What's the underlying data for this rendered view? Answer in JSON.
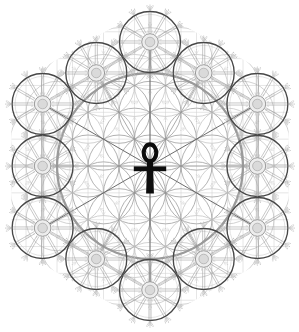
{
  "diagram": {
    "central_symbol": "ankh-icon",
    "canvas": {
      "width": 299,
      "height": 332,
      "background": "#ffffff"
    },
    "center": {
      "x": 150,
      "y": 166
    },
    "lattice_spacing": 31,
    "row_height": 26.846,
    "clip_hex_radius": 160,
    "grid": {
      "h_half_count": 6,
      "v_half_count": 9,
      "v_spacing": 15.5
    },
    "flower": {
      "petal_radius": 31,
      "extent": 122,
      "inner_extent": 63,
      "ghost_burst_min_dist": 80
    },
    "big_circle": {
      "radius": 93,
      "outer_radius": 96.5
    },
    "ring": {
      "wheel_count": 12,
      "start_angle_deg": -90,
      "step_angle_deg": 30,
      "vertex_ring_radius": 124,
      "mid_ring_radius": 107.4
    },
    "wheel": {
      "radius": 30.5,
      "inner_ring_radius": 27.6,
      "spoke_count": 12,
      "spoke_inner_radius": 9.2,
      "spoke_outer_radius": 29.8,
      "spoke_pair_offset": 1.05,
      "hub_radius": 8.3,
      "hub_inner_radius": 4.8,
      "hub_tick_count": 16,
      "hub_tick_r1": 9.3,
      "hub_tick_r2": 11.8,
      "burst_count": 12,
      "burst_ray_spreads": [
        -36,
        -18,
        0,
        18,
        36
      ],
      "burst_ray_start": 0.8,
      "burst_ray_end": 5.3,
      "burst_dot_spreads": [
        -30,
        0,
        30
      ],
      "burst_dot_dist": 6.0,
      "burst_dot_r": 0.6
    },
    "ghost_burst": {
      "count": 6,
      "ray_spreads": [
        -25,
        0,
        25
      ],
      "ray_start": 0.8,
      "ray_end": 4.2,
      "dot_dist": 5.0,
      "dot_r": 0.55
    },
    "ankh": {
      "loop_cx": 150,
      "loop_cy": 152.8,
      "loop_rx": 6.3,
      "loop_ry": 8.4,
      "loop_stroke": 4.1,
      "shaft_top": 160.5,
      "shaft_bottom": 193.5,
      "shaft_top_halfwidth": 2.9,
      "shaft_bottom_halfwidth": 3.9,
      "bar_x": 133.8,
      "bar_y": 166.4,
      "bar_w": 32.4,
      "bar_h": 4.8
    },
    "colors": {
      "background": "#ffffff",
      "grid": "#d2d2d2",
      "flower_inner": "#9e9e9e",
      "flower_outer": "#bfbfbf",
      "big_circle": "#9a9a9a",
      "big_circle_outer": "#c8c8c8",
      "dodecagon": "#c0c0c0",
      "radial_vertex": "#646464",
      "radial_mid": "#909090",
      "wheel_rim": "#474747",
      "wheel_inner_ring": "#c6c6c6",
      "spokes": "#9a9a9a",
      "hub_stroke": "#8f8f8f",
      "hub_fill": "#ededed",
      "hub_inner_stroke": "#a8a8a8",
      "hub_inner_fill": "#dadada",
      "hub_ticks": "#b4b4b4",
      "bursts": "#b5b5b5",
      "burst_dots": "#c0c0c0",
      "ghost_bursts": "#cecece",
      "ankh": "#0c0c0c"
    }
  }
}
